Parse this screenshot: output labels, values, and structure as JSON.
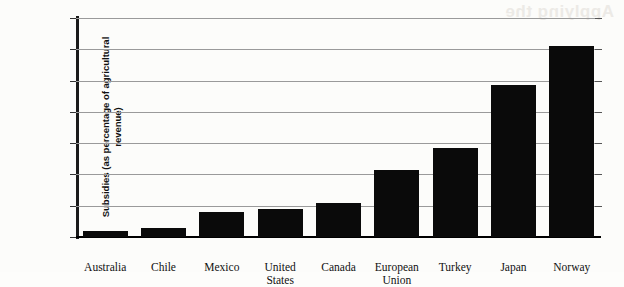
{
  "figure": {
    "bleed_text": "Applying the",
    "background_color": "#fcfcfa",
    "bar_color": "#0a0a0a",
    "grid_color": "#9a9a9a",
    "axis_color": "#1a1a1a"
  },
  "chart_data": {
    "type": "bar",
    "title": "",
    "xlabel": "",
    "ylabel": "Subsidies (as percentage of agricultural revenue)",
    "ylim": [
      0,
      70
    ],
    "yticks": [
      0,
      10,
      20,
      30,
      40,
      50,
      60,
      70
    ],
    "ytick_labels": [
      "0",
      "10",
      "20",
      "30",
      "40",
      "50",
      "60",
      "70"
    ],
    "grid": true,
    "legend": false,
    "categories": [
      "Australia",
      "Chile",
      "Mexico",
      "United States",
      "Canada",
      "European Union",
      "Turkey",
      "Japan",
      "Norway"
    ],
    "category_lines": [
      [
        "Australia"
      ],
      [
        "Chile"
      ],
      [
        "Mexico"
      ],
      [
        "United",
        "States"
      ],
      [
        "Canada"
      ],
      [
        "European",
        "Union"
      ],
      [
        "Turkey"
      ],
      [
        "Japan"
      ],
      [
        "Norway"
      ]
    ],
    "values": [
      2,
      3,
      8,
      9,
      11,
      21.5,
      28.5,
      48.5,
      61
    ]
  }
}
